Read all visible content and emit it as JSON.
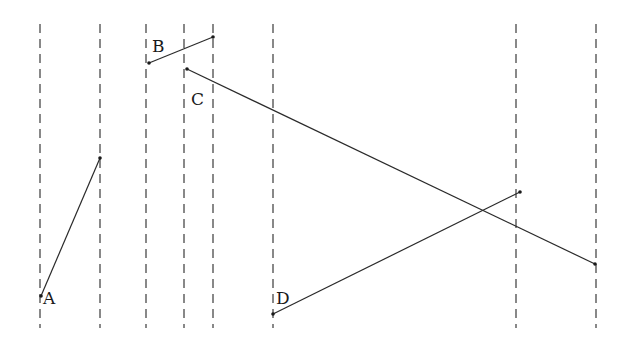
{
  "diagram": {
    "width": 631,
    "height": 341,
    "guide_top": 24,
    "guide_bottom": 328,
    "guides_x": [
      40,
      100,
      146,
      184,
      213,
      273,
      516,
      596
    ],
    "segments": [
      {
        "label": "A",
        "x1": 41,
        "y1": 296,
        "x2": 100,
        "y2": 158,
        "label_x": 43,
        "label_y": 304
      },
      {
        "label": "B",
        "x1": 149,
        "y1": 63,
        "x2": 213,
        "y2": 37,
        "label_x": 152,
        "label_y": 52
      },
      {
        "label": "C",
        "x1": 187,
        "y1": 69,
        "x2": 595,
        "y2": 264,
        "label_x": 191,
        "label_y": 105
      },
      {
        "label": "D",
        "x1": 273,
        "y1": 314,
        "x2": 520,
        "y2": 192,
        "label_x": 276,
        "label_y": 304
      }
    ],
    "colors": {
      "line": "#2a2a2a",
      "guide": "#3a3a3a",
      "background": "#ffffff"
    }
  }
}
